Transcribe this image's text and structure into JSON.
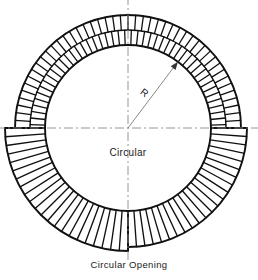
{
  "figure": {
    "caption": "Circular Opening",
    "interior_label": "Circular",
    "radius_label": "R",
    "background_color": "#ffffff",
    "line_color": "#111111",
    "centerline_color": "#8a8a8a",
    "dimension_line_color": "#7a7a7a"
  },
  "geometry": {
    "center_x": 128,
    "center_y": 128,
    "inner_radius": 83,
    "outer_radius_upper": 113,
    "outer_radius_lower": 119,
    "mid_radius_upper": 98,
    "radius_arrow_angle_deg": -53,
    "upper_course_count": 46,
    "lower_course_count": 44,
    "centerline_extent": 132
  },
  "centerlines": [
    {
      "name": "horizontal-centerline",
      "orientation": "horizontal"
    },
    {
      "name": "vertical-centerline",
      "orientation": "vertical"
    }
  ],
  "annotations": {
    "radius_dimension": {
      "label": "R",
      "from": "center",
      "to": "inner-circle-edge",
      "arrowhead": true
    }
  }
}
